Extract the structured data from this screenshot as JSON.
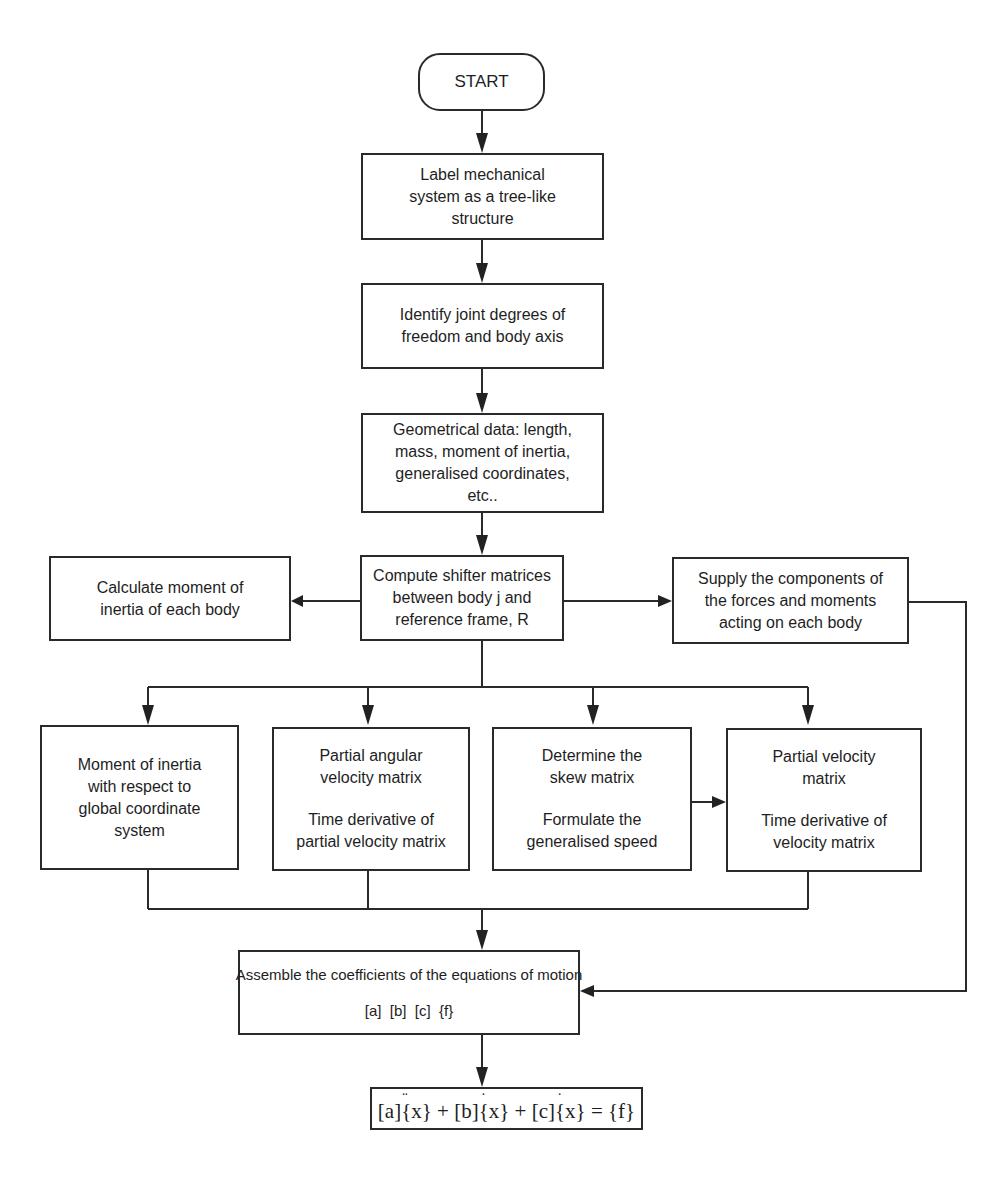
{
  "flowchart": {
    "start": {
      "label": "START"
    },
    "label_system": {
      "lines": [
        "Label mechanical",
        "system as a tree-like",
        "structure"
      ]
    },
    "identify_dof": {
      "lines": [
        "Identify joint degrees of",
        "freedom and body axis"
      ]
    },
    "geometrical_data": {
      "lines": [
        "Geometrical data:  length,",
        "mass, moment of inertia,",
        "generalised coordinates,",
        "etc.."
      ]
    },
    "compute_shifter": {
      "lines": [
        "Compute shifter matrices",
        "between body j and",
        "reference frame, R"
      ]
    },
    "calculate_moment": {
      "lines": [
        "Calculate moment of",
        "inertia of each body"
      ]
    },
    "supply_forces": {
      "lines": [
        "Supply the components of",
        "the forces and moments",
        "acting on each body"
      ]
    },
    "moment_global": {
      "lines": [
        "Moment of inertia",
        "with respect to",
        "global coordinate",
        "system"
      ]
    },
    "partial_angular": {
      "lines_a": [
        "Partial angular",
        "velocity matrix"
      ],
      "lines_b": [
        "Time derivative of",
        "partial velocity matrix"
      ]
    },
    "skew_matrix": {
      "lines_a": [
        "Determine the",
        "skew matrix"
      ],
      "lines_b": [
        "Formulate the",
        "generalised speed"
      ]
    },
    "partial_velocity": {
      "lines_a": [
        "Partial velocity",
        "matrix"
      ],
      "lines_b": [
        "Time derivative of",
        "velocity matrix"
      ]
    },
    "assemble": {
      "title": "Assemble the coefficients of the equations of motion",
      "coefficients": "[a]  [b]  [c]  {f}"
    },
    "equation": {
      "a": "[a]",
      "x1": "{x}",
      "plus1": " + ",
      "b": "[b]",
      "x2": "{x}",
      "plus2": " + ",
      "c": "[c]",
      "x3": "{x}",
      "equals": " = ",
      "f": "{f}",
      "full_text": "[a]{ẍ} + [b]{ẋ} + [c]{ẋ} = {f}"
    }
  }
}
